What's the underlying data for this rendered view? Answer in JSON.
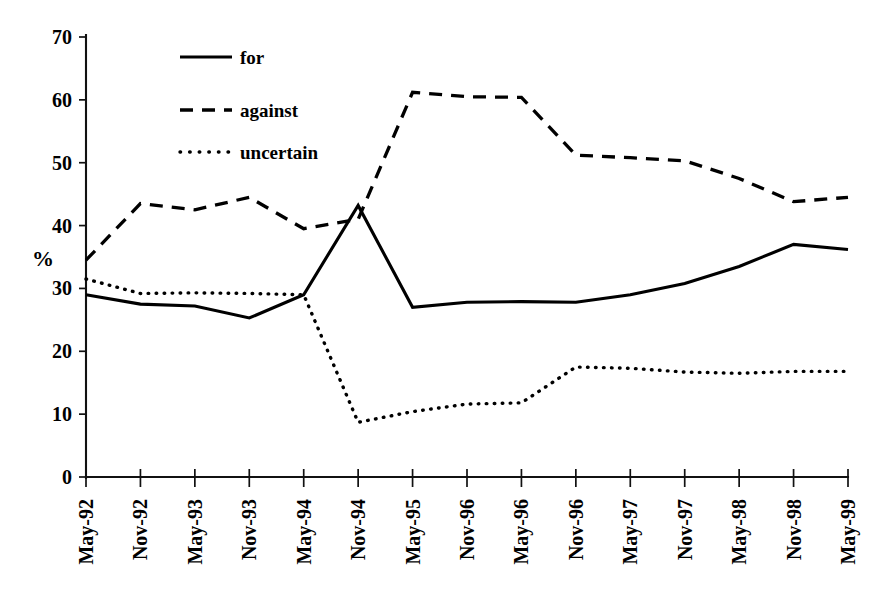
{
  "chart_data": {
    "type": "line",
    "title": "",
    "subtitle": "",
    "xlabel": "",
    "ylabel": "%",
    "ylim": [
      0,
      70
    ],
    "ytick_step": 10,
    "yticks": [
      "0",
      "10",
      "20",
      "30",
      "40",
      "50",
      "60",
      "70"
    ],
    "grid": false,
    "legend_position": "upper-left-inside",
    "categories": [
      "May-92",
      "Nov-92",
      "May-93",
      "Nov-93",
      "May-94",
      "Nov-94",
      "May-95",
      "Nov-96",
      "May-96",
      "Nov-96",
      "May-97",
      "Nov-97",
      "May-98",
      "Nov-98",
      "May-99"
    ],
    "series": [
      {
        "name": "for",
        "style": "solid",
        "values": [
          29.0,
          27.5,
          27.2,
          25.3,
          29.0,
          43.2,
          27.0,
          27.8,
          27.9,
          27.8,
          29.0,
          30.8,
          33.5,
          37.0,
          36.2
        ]
      },
      {
        "name": "against",
        "style": "dashed",
        "values": [
          34.5,
          43.5,
          42.5,
          44.5,
          39.5,
          41.0,
          61.2,
          60.5,
          60.4,
          51.2,
          50.8,
          50.3,
          47.5,
          43.8,
          44.5
        ]
      },
      {
        "name": "uncertain",
        "style": "dotted",
        "values": [
          31.5,
          29.2,
          29.3,
          29.2,
          29.0,
          8.7,
          10.4,
          11.6,
          11.8,
          17.5,
          17.3,
          16.7,
          16.5,
          16.8,
          16.8
        ]
      }
    ]
  },
  "legend": {
    "items": [
      {
        "label": "for",
        "style": "solid"
      },
      {
        "label": "against",
        "style": "dashed"
      },
      {
        "label": "uncertain",
        "style": "dotted"
      }
    ]
  },
  "axes": {
    "y_axis_title": "%",
    "y_tick_labels": [
      "70",
      "60",
      "50",
      "40",
      "30",
      "20",
      "10",
      "0"
    ],
    "x_tick_labels": [
      "May-92",
      "Nov-92",
      "May-93",
      "Nov-93",
      "May-94",
      "Nov-94",
      "May-95",
      "Nov-96",
      "May-96",
      "Nov-96",
      "May-97",
      "Nov-97",
      "May-98",
      "Nov-98",
      "May-99"
    ]
  },
  "colors": {
    "ink": "#000000",
    "background": "#ffffff"
  }
}
